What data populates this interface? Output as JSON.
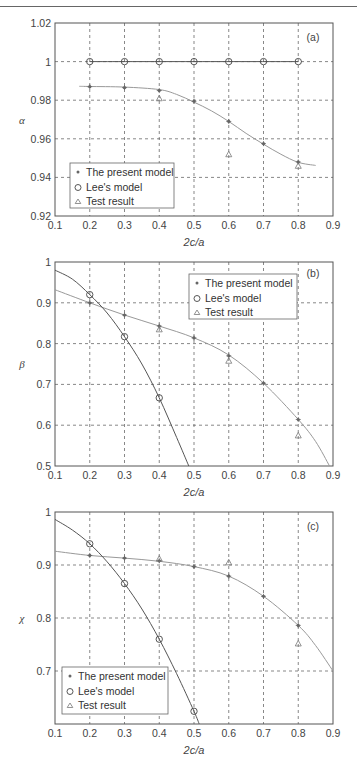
{
  "chart_data": [
    {
      "type": "line",
      "panel_label": "(a)",
      "title": "",
      "xlabel": "2c/a",
      "ylabel": "α",
      "xlim": [
        0.1,
        0.9
      ],
      "ylim": [
        0.92,
        1.02
      ],
      "xticks": [
        "0.1",
        "0.2",
        "0.3",
        "0.4",
        "0.5",
        "0.6",
        "0.7",
        "0.8",
        "0.9"
      ],
      "yticks": [
        "0.92",
        "0.94",
        "0.96",
        "0.98",
        "1",
        "1.02"
      ],
      "grid": true,
      "legend_position": "lower left",
      "legend": [
        "The present model",
        "Lee's model",
        "Test result"
      ],
      "series": [
        {
          "name": "The present model",
          "marker": "asterisk",
          "x": [
            0.2,
            0.3,
            0.4,
            0.5,
            0.6,
            0.7,
            0.8
          ],
          "values": [
            0.987,
            0.9865,
            0.985,
            0.9795,
            0.969,
            0.9575,
            0.948
          ],
          "curve_x": [
            0.17,
            0.2,
            0.3,
            0.4,
            0.45,
            0.5,
            0.55,
            0.6,
            0.65,
            0.7,
            0.75,
            0.8,
            0.85
          ],
          "curve_y": [
            0.9872,
            0.9871,
            0.9868,
            0.9855,
            0.983,
            0.979,
            0.9745,
            0.969,
            0.9628,
            0.9572,
            0.952,
            0.9478,
            0.9462
          ]
        },
        {
          "name": "Lee's model",
          "marker": "circle",
          "x": [
            0.2,
            0.3,
            0.4,
            0.5,
            0.6,
            0.7,
            0.8
          ],
          "values": [
            1,
            1,
            1,
            1,
            1,
            1,
            1
          ],
          "curve_x": [
            0.2,
            0.8
          ],
          "curve_y": [
            1,
            1
          ]
        },
        {
          "name": "Test result",
          "marker": "triangle",
          "x": [
            0.4,
            0.6,
            0.8
          ],
          "values": [
            0.981,
            0.952,
            0.946
          ]
        }
      ]
    },
    {
      "type": "line",
      "panel_label": "(b)",
      "title": "",
      "xlabel": "2c/a",
      "ylabel": "β",
      "xlim": [
        0.1,
        0.9
      ],
      "ylim": [
        0.5,
        1.0
      ],
      "xticks": [
        "0.1",
        "0.2",
        "0.3",
        "0.4",
        "0.5",
        "0.6",
        "0.7",
        "0.8",
        "0.9"
      ],
      "yticks": [
        "0.5",
        "0.6",
        "0.7",
        "0.8",
        "0.9",
        "1"
      ],
      "grid": true,
      "legend_position": "upper right",
      "legend": [
        "The present model",
        "Lee's model",
        "Test result"
      ],
      "series": [
        {
          "name": "The present model",
          "marker": "asterisk",
          "x": [
            0.2,
            0.3,
            0.4,
            0.5,
            0.6,
            0.7,
            0.8
          ],
          "values": [
            0.9,
            0.87,
            0.843,
            0.814,
            0.77,
            0.703,
            0.614
          ],
          "curve_x": [
            0.1,
            0.2,
            0.3,
            0.4,
            0.5,
            0.6,
            0.7,
            0.8,
            0.85,
            0.89
          ],
          "curve_y": [
            0.932,
            0.9,
            0.87,
            0.843,
            0.814,
            0.772,
            0.703,
            0.614,
            0.56,
            0.5
          ]
        },
        {
          "name": "Lee's model",
          "marker": "circle",
          "x": [
            0.2,
            0.3,
            0.4
          ],
          "values": [
            0.92,
            0.817,
            0.667
          ],
          "curve_x": [
            0.1,
            0.15,
            0.2,
            0.25,
            0.3,
            0.35,
            0.4,
            0.45,
            0.485
          ],
          "curve_y": [
            0.98,
            0.958,
            0.92,
            0.875,
            0.817,
            0.75,
            0.667,
            0.57,
            0.5
          ]
        },
        {
          "name": "Test result",
          "marker": "triangle",
          "x": [
            0.4,
            0.6,
            0.8
          ],
          "values": [
            0.835,
            0.758,
            0.575
          ]
        }
      ]
    },
    {
      "type": "line",
      "panel_label": "(c)",
      "title": "",
      "xlabel": "2c/a",
      "ylabel": "χ",
      "xlim": [
        0.1,
        0.9
      ],
      "ylim": [
        0.6,
        1.0
      ],
      "xticks": [
        "0.1",
        "0.2",
        "0.3",
        "0.4",
        "0.5",
        "0.6",
        "0.7",
        "0.8",
        "0.9"
      ],
      "yticks": [
        "",
        "0.7",
        "0.8",
        "0.9",
        "1"
      ],
      "grid": true,
      "legend_position": "lower left",
      "legend": [
        "The present model",
        "Lee's model",
        "Test result"
      ],
      "series": [
        {
          "name": "The present model",
          "marker": "asterisk",
          "x": [
            0.2,
            0.3,
            0.4,
            0.5,
            0.6,
            0.7,
            0.8
          ],
          "values": [
            0.918,
            0.913,
            0.908,
            0.897,
            0.879,
            0.841,
            0.786
          ],
          "curve_x": [
            0.1,
            0.2,
            0.3,
            0.4,
            0.5,
            0.6,
            0.7,
            0.8,
            0.85,
            0.9
          ],
          "curve_y": [
            0.926,
            0.918,
            0.913,
            0.907,
            0.897,
            0.879,
            0.841,
            0.786,
            0.748,
            0.7
          ]
        },
        {
          "name": "Lee's model",
          "marker": "circle",
          "x": [
            0.2,
            0.3,
            0.4,
            0.5
          ],
          "values": [
            0.94,
            0.865,
            0.76,
            0.624
          ],
          "curve_x": [
            0.1,
            0.15,
            0.2,
            0.25,
            0.3,
            0.35,
            0.4,
            0.45,
            0.5,
            0.515
          ],
          "curve_y": [
            0.986,
            0.966,
            0.94,
            0.906,
            0.865,
            0.817,
            0.76,
            0.695,
            0.624,
            0.6
          ]
        },
        {
          "name": "Test result",
          "marker": "triangle",
          "x": [
            0.4,
            0.6,
            0.8
          ],
          "values": [
            0.912,
            0.905,
            0.752
          ]
        }
      ]
    }
  ],
  "layout": {
    "panels": [
      {
        "top": 23,
        "bottom": 216,
        "left": 55,
        "right": 333,
        "legend": {
          "x": 70,
          "y": 163,
          "w": 104,
          "h": 45
        }
      },
      {
        "top": 262,
        "bottom": 466,
        "left": 55,
        "right": 333,
        "legend": {
          "x": 189,
          "y": 274,
          "w": 108,
          "h": 45
        }
      },
      {
        "top": 512,
        "bottom": 724,
        "left": 55,
        "right": 333,
        "legend": {
          "x": 62,
          "y": 667,
          "w": 106,
          "h": 47
        }
      }
    ]
  },
  "colors": {
    "axis": "#555555",
    "grid": "#555555",
    "present_model": "#999999",
    "lee_model": "#555555",
    "marker": "#666666"
  }
}
